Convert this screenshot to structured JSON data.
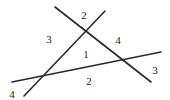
{
  "diagram": {
    "lines": [
      {
        "id": "A",
        "x1": 55,
        "y1": 7,
        "x2": 151,
        "y2": 82
      },
      {
        "id": "B",
        "x1": 24,
        "y1": 96,
        "x2": 105,
        "y2": 11
      },
      {
        "id": "C",
        "x1": 12,
        "y1": 82,
        "x2": 161,
        "y2": 52
      }
    ],
    "labels": [
      {
        "text": "2",
        "x": 84,
        "y": 19
      },
      {
        "text": "3",
        "x": 49,
        "y": 43
      },
      {
        "text": "4",
        "x": 118,
        "y": 44
      },
      {
        "text": "1",
        "x": 86,
        "y": 58
      },
      {
        "text": "3",
        "x": 155,
        "y": 74
      },
      {
        "text": "2",
        "x": 89,
        "y": 85
      },
      {
        "text": "4",
        "x": 12,
        "y": 98
      }
    ]
  }
}
